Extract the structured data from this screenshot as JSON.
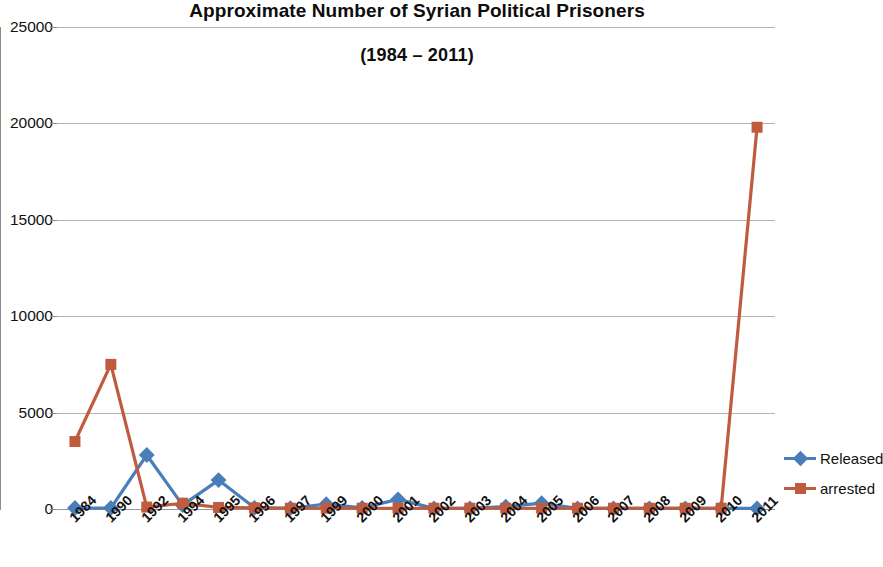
{
  "chart_data": {
    "type": "line",
    "title": "Approximate Number of Syrian Political Prisoners",
    "subtitle": "(1984 – 2011)",
    "xlabel": "",
    "ylabel": "",
    "ylim": [
      0,
      25000
    ],
    "yticks": [
      0,
      5000,
      10000,
      15000,
      20000,
      25000
    ],
    "ytick_labels": [
      "0",
      "5000",
      "10000",
      "15000",
      "20000",
      "25000"
    ],
    "grid": true,
    "grid_axis": "y",
    "legend_position": "right",
    "categories": [
      "1984",
      "1990",
      "1992",
      "1994",
      "1995",
      "1996",
      "1997",
      "1999",
      "2000",
      "2001",
      "2002",
      "2003",
      "2004",
      "2005",
      "2006",
      "2007",
      "2008",
      "2009",
      "2010",
      "2011"
    ],
    "series": [
      {
        "name": "Released",
        "color": "#4a7ebb",
        "marker": "diamond",
        "values": [
          50,
          50,
          2800,
          200,
          1500,
          60,
          40,
          250,
          60,
          500,
          30,
          30,
          120,
          300,
          30,
          30,
          30,
          30,
          30,
          30
        ]
      },
      {
        "name": "arrested",
        "color": "#bf5b3f",
        "marker": "square",
        "values": [
          3500,
          7500,
          100,
          300,
          80,
          60,
          40,
          40,
          40,
          40,
          40,
          40,
          40,
          40,
          40,
          40,
          40,
          40,
          40,
          19800
        ]
      }
    ]
  },
  "legend": {
    "items": [
      {
        "label": "Released",
        "color": "#4a7ebb",
        "marker": "diamond"
      },
      {
        "label": "arrested",
        "color": "#bf5b3f",
        "marker": "square"
      }
    ]
  }
}
